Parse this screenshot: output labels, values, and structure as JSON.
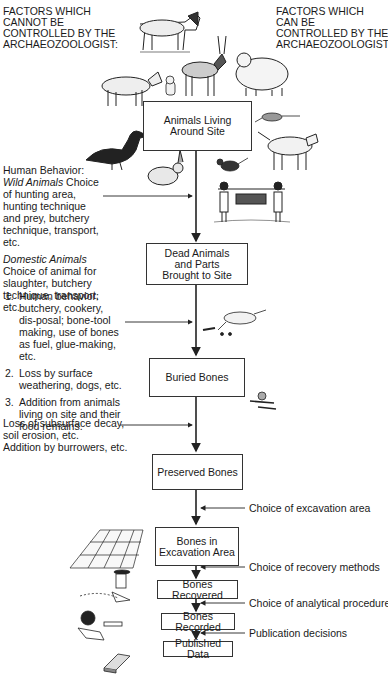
{
  "headings": {
    "left": [
      "FACTORS WHICH",
      "CANNOT BE",
      "CONTROLLED BY THE",
      "ARCHAEOZOOLOGIST:"
    ],
    "right": [
      "FACTORS WHICH",
      "CAN BE",
      "CONTROLLED BY THE",
      "ARCHAEOZOOLOGIST:"
    ]
  },
  "flow": {
    "boxes": [
      {
        "id": "animals-living",
        "label": "Animals Living\nAround Site"
      },
      {
        "id": "dead-animals",
        "label": "Dead Animals\nand Parts\nBrought to Site"
      },
      {
        "id": "buried-bones",
        "label": "Buried Bones"
      },
      {
        "id": "preserved-bones",
        "label": "Preserved Bones"
      },
      {
        "id": "bones-excavation",
        "label": "Bones in\nExcavation Area"
      },
      {
        "id": "bones-recovered",
        "label": "Bones Recovered"
      },
      {
        "id": "bones-recorded",
        "label": "Bones Recorded"
      },
      {
        "id": "published-data",
        "label": "Published Data"
      }
    ]
  },
  "left_factors": {
    "human_behavior": {
      "title": "Human Behavior:",
      "wild_label": "Wild Animals",
      "wild_text": " Choice of hunting area, hunting technique and prey, butchery technique, transport, etc.",
      "domestic_label": "Domestic Animals",
      "domestic_text": " Choice of animal for slaughter, butchery technique, transport, etc."
    },
    "site_processes": [
      {
        "num": "1.",
        "text": "Human behavior: butchery, cookery, dis-posal; bone-tool making, use of bones as fuel, glue-making, etc."
      },
      {
        "num": "2.",
        "text": "Loss by surface weathering, dogs, etc."
      },
      {
        "num": "3.",
        "text": "Addition from animals living on site and their food remains."
      }
    ],
    "subsurface": [
      "Loss of subsurface decay,",
      "soil erosion, etc.",
      "Addition by burrowers, etc."
    ]
  },
  "right_factors": [
    "Choice of excavation area",
    "Choice of recovery methods",
    "Choice of analytical procedures",
    "Publication decisions"
  ],
  "illustrations": [
    "horse",
    "goat",
    "cat",
    "antelope",
    "sheep",
    "duck",
    "rabbit",
    "rat",
    "dog",
    "bird",
    "hunters-carrying-animal",
    "dog-gnawing-bones",
    "burrowing-animal",
    "excavation-grid",
    "archaeologist-excavating",
    "archaeologist-recording",
    "book"
  ],
  "colors": {
    "line": "#222222",
    "text": "#1a1a1a",
    "background": "#ffffff"
  }
}
